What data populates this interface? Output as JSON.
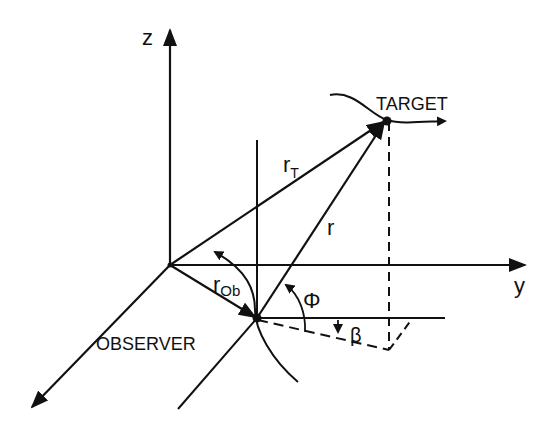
{
  "diagram": {
    "axes": {
      "z_label": "z",
      "y_label": "y"
    },
    "points": {
      "target_label": "TARGET",
      "observer_label": "OBSERVER"
    },
    "vectors": {
      "r_target_main": "r",
      "r_target_sub": "T",
      "r_observer_main": "r",
      "r_observer_sub": "Ob",
      "r_relative": "r"
    },
    "angles": {
      "azimuth": "Φ",
      "elevation": "β"
    },
    "colors": {
      "ink": "#111111",
      "background": "#ffffff"
    }
  }
}
